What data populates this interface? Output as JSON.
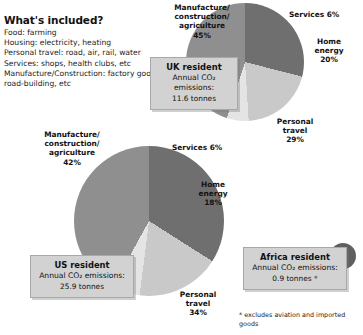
{
  "included": {
    "heading": "What's included?",
    "items": [
      "Food: farming",
      "Housing: electricity, heating",
      "Personal travel: road, air, rail, water",
      "Services: shops, health clubs, etc",
      "Manufacture/Construction: factory goods, road-building, etc"
    ]
  },
  "uk": {
    "box": {
      "title": "UK resident",
      "metric": "Annual CO₂ emissions:",
      "value": "11.6 tonnes"
    },
    "labels": {
      "manufacture": "Manufacture/\nconstruction/\nagriculture\n45%",
      "services": "Services 6%",
      "home": "Home\nenergy\n20%",
      "travel": "Personal\ntravel\n29%"
    }
  },
  "us": {
    "box": {
      "title": "US resident",
      "metric": "Annual CO₂ emissions:",
      "value": "25.9 tonnes"
    },
    "labels": {
      "manufacture": "Manufacture/\nconstruction/\nagriculture\n42%",
      "services": "Services 6%",
      "home": "Home\nenergy\n18%",
      "travel": "Personal\ntravel\n34%"
    }
  },
  "africa": {
    "box": {
      "title": "Africa resident",
      "metric": "Annual CO₂ emissions:",
      "value": "0.9 tonnes *"
    }
  },
  "footnote": "* excludes aviation and imported goods",
  "colors": {
    "manufacture": "#8f8f8f",
    "services": "#e4e4e4",
    "home_energy": "#c9c9c9",
    "personal_travel": "#6f6f6f",
    "africa": "#5f5f5f",
    "callout_bg": "#d2d2d2"
  },
  "chart_data": [
    {
      "type": "pie",
      "title": "UK resident",
      "subtitle": "Annual CO2 emissions: 11.6 tonnes",
      "categories": [
        "Manufacture/construction/agriculture",
        "Services",
        "Home energy",
        "Personal travel"
      ],
      "values": [
        45,
        6,
        20,
        29
      ],
      "unit": "%",
      "total_tonnes": 11.6,
      "legend": "labels placed around slices"
    },
    {
      "type": "pie",
      "title": "US resident",
      "subtitle": "Annual CO2 emissions: 25.9 tonnes",
      "categories": [
        "Manufacture/construction/agriculture",
        "Services",
        "Home energy",
        "Personal travel"
      ],
      "values": [
        42,
        6,
        18,
        34
      ],
      "unit": "%",
      "total_tonnes": 25.9,
      "legend": "labels placed around slices"
    },
    {
      "type": "pie",
      "title": "Africa resident",
      "subtitle": "Annual CO2 emissions: 0.9 tonnes *",
      "categories": [
        "Total"
      ],
      "values": [
        100
      ],
      "unit": "%",
      "total_tonnes": 0.9,
      "note": "* excludes aviation and imported goods"
    }
  ]
}
